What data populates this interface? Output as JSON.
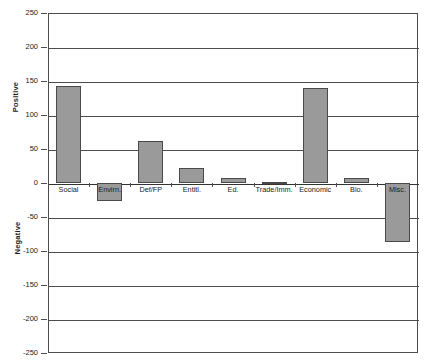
{
  "chart_data": {
    "type": "bar",
    "title": "",
    "subtitle": "",
    "xlabel": "",
    "ylabel": "",
    "categories": [
      "Social",
      "Envirn.",
      "Def/FP",
      "Entitl.",
      "Ed.",
      "Trade/Imm.",
      "Economic",
      "Bio.",
      "Misc."
    ],
    "values": [
      143,
      -27,
      62,
      22,
      8,
      2,
      139,
      8,
      -87
    ],
    "series": [
      {
        "name": "",
        "values": [
          143,
          -27,
          62,
          22,
          8,
          2,
          139,
          8,
          -87
        ]
      }
    ],
    "ylim": [
      -250,
      250
    ],
    "ytick_values": [
      250,
      200,
      150,
      100,
      50,
      0,
      -50,
      -100,
      -150,
      -200,
      -250
    ],
    "ytick_labels": [
      "250",
      "200",
      "150",
      "100",
      "50",
      "0",
      "-50",
      "-100",
      "-150",
      "-200",
      "-250"
    ],
    "grid": true,
    "grid_axis": "y",
    "legend": false,
    "legend_position": "none",
    "axis_group_labels": {
      "positive": "Positive",
      "negative": "Negative"
    },
    "bar_color": "#9a9a9a",
    "bar_border_color": "#4a4a4a",
    "axis_color": "#4d4d4d",
    "text_color": "#1a1a1a",
    "background_color": "#ffffff"
  }
}
